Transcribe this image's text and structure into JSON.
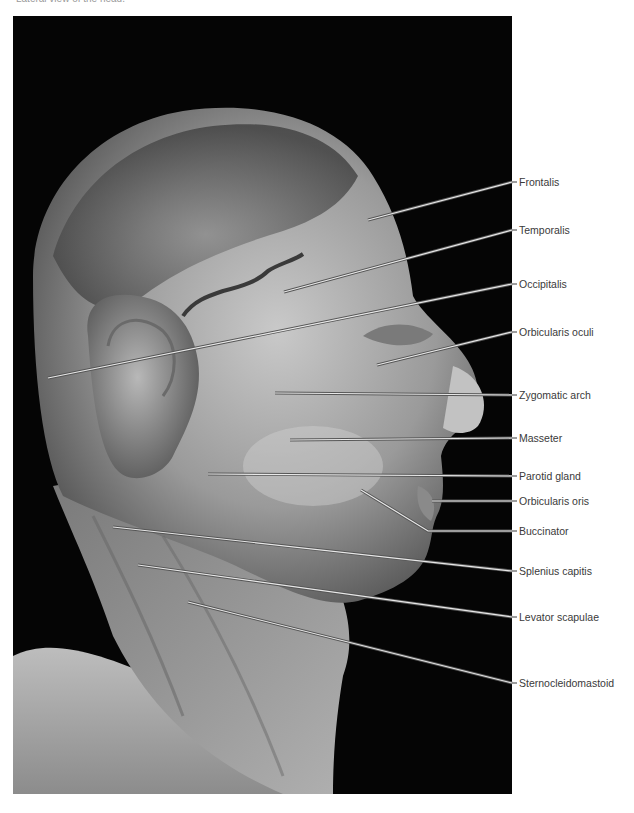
{
  "figure": {
    "caption": "Lateral view of the head.",
    "photo_description": "Grayscale dissection photograph of the head and neck, lateral view, on black background",
    "background_color": "#050505",
    "label_text_color": "#3a3a3a",
    "leader_line_color": "#e8e8e8"
  },
  "labels": [
    {
      "text": "Frontalis",
      "label_y": 182,
      "line": [
        [
          368,
          220
        ],
        [
          512,
          182
        ]
      ]
    },
    {
      "text": "Temporalis",
      "label_y": 230,
      "line": [
        [
          284,
          292
        ],
        [
          512,
          230
        ]
      ]
    },
    {
      "text": "Occipitalis",
      "label_y": 284,
      "line": [
        [
          48,
          378
        ],
        [
          512,
          284
        ]
      ]
    },
    {
      "text": "Orbicularis oculi",
      "label_y": 332,
      "line": [
        [
          377,
          365
        ],
        [
          512,
          332
        ]
      ]
    },
    {
      "text": "Zygomatic arch",
      "label_y": 395,
      "line": [
        [
          275,
          393
        ],
        [
          512,
          395
        ]
      ]
    },
    {
      "text": "Masseter",
      "label_y": 438,
      "line": [
        [
          290,
          440
        ],
        [
          512,
          438
        ]
      ]
    },
    {
      "text": "Parotid gland",
      "label_y": 476,
      "line": [
        [
          208,
          474
        ],
        [
          512,
          476
        ]
      ]
    },
    {
      "text": "Orbicularis oris",
      "label_y": 501,
      "line": [
        [
          432,
          501
        ],
        [
          512,
          501
        ]
      ]
    },
    {
      "text": "Buccinator",
      "label_y": 531,
      "line": [
        [
          361,
          490
        ],
        [
          428,
          531
        ],
        [
          512,
          531
        ]
      ]
    },
    {
      "text": "Splenius capitis",
      "label_y": 571,
      "line": [
        [
          113,
          527
        ],
        [
          512,
          571
        ]
      ]
    },
    {
      "text": "Levator scapulae",
      "label_y": 617,
      "line": [
        [
          138,
          565
        ],
        [
          512,
          617
        ]
      ]
    },
    {
      "text": "Sternocleidomastoid",
      "label_y": 683,
      "line": [
        [
          188,
          602
        ],
        [
          512,
          683
        ]
      ]
    }
  ]
}
